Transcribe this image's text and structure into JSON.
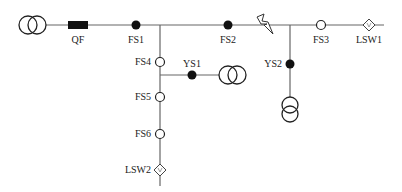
{
  "diagram": {
    "colors": {
      "line": "#666666",
      "symbol": "#222222",
      "filled": "#111111",
      "background": "#ffffff"
    },
    "labels": {
      "QF": "QF",
      "FS1": "FS1",
      "FS2": "FS2",
      "FS3": "FS3",
      "FS4": "FS4",
      "FS5": "FS5",
      "FS6": "FS6",
      "YS1": "YS1",
      "YS2": "YS2",
      "LSW1": "LSW1",
      "LSW2": "LSW2"
    },
    "components": [
      {
        "id": "T0",
        "type": "transformer",
        "orientation": "horizontal"
      },
      {
        "id": "QF",
        "type": "circuit-breaker"
      },
      {
        "id": "FS1",
        "type": "switch",
        "state": "closed"
      },
      {
        "id": "FS2",
        "type": "switch",
        "state": "closed"
      },
      {
        "id": "FAULT",
        "type": "fault-lightning"
      },
      {
        "id": "FS3",
        "type": "switch",
        "state": "open"
      },
      {
        "id": "LSW1",
        "type": "tie-switch"
      },
      {
        "id": "FS4",
        "type": "switch",
        "state": "open"
      },
      {
        "id": "YS1",
        "type": "switch",
        "state": "closed"
      },
      {
        "id": "T1",
        "type": "transformer",
        "orientation": "horizontal"
      },
      {
        "id": "FS5",
        "type": "switch",
        "state": "open"
      },
      {
        "id": "FS6",
        "type": "switch",
        "state": "open"
      },
      {
        "id": "LSW2",
        "type": "tie-switch"
      },
      {
        "id": "YS2",
        "type": "switch",
        "state": "closed"
      },
      {
        "id": "T2",
        "type": "transformer",
        "orientation": "vertical"
      }
    ]
  }
}
